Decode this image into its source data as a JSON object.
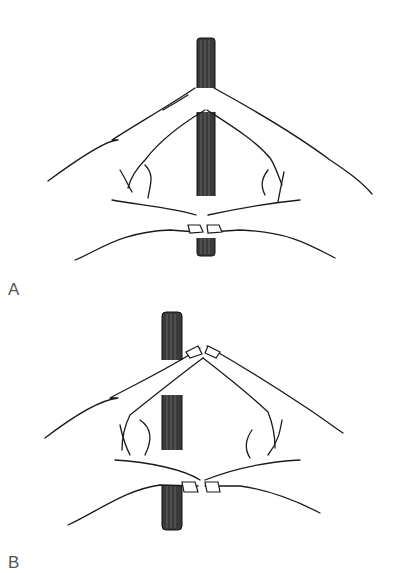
{
  "figure": {
    "panels": [
      {
        "id": "A",
        "label": "A",
        "description": "Two hands forming a triangle in front of a vertical rod; rod centered between fingertips"
      },
      {
        "id": "B",
        "label": "B",
        "description": "Two hands forming a triangle; rod offset to the left, behind the left hand"
      }
    ]
  }
}
